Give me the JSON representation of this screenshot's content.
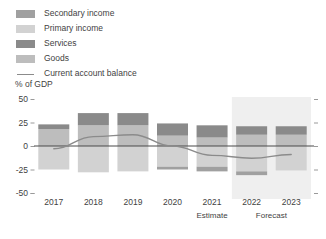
{
  "legend": {
    "items": [
      {
        "label": "Secondary income",
        "color": "#a0a0a0",
        "kind": "swatch",
        "icon": "legend-swatch"
      },
      {
        "label": "Primary income",
        "color": "#d2d2d2",
        "kind": "swatch",
        "icon": "legend-swatch"
      },
      {
        "label": "Services",
        "color": "#8a8a8a",
        "kind": "swatch",
        "icon": "legend-swatch"
      },
      {
        "label": "Goods",
        "color": "#bdbdbd",
        "kind": "swatch",
        "icon": "legend-swatch"
      },
      {
        "label": "Current account balance",
        "color": "#8b8b8b",
        "kind": "line",
        "icon": "legend-line"
      }
    ]
  },
  "chart_data": {
    "type": "bar",
    "title": "",
    "subtitle": "",
    "xlabel": "",
    "ylabel": "% of GDP",
    "ylim": [
      -50,
      50
    ],
    "yticks": [
      50,
      25,
      0,
      -25,
      -50
    ],
    "ytick_labels": [
      "50",
      "25",
      "0",
      "-25",
      "-50"
    ],
    "grid": false,
    "stacked": true,
    "legend_position": "top-left",
    "categories": [
      "2017",
      "2018",
      "2019",
      "2020",
      "2021",
      "2022",
      "2023"
    ],
    "category_sublabels": [
      "",
      "",
      "",
      "",
      "Estimate",
      "Forecast",
      ""
    ],
    "forecast_band": {
      "from": "2022",
      "to": "2023",
      "color": "#efefef",
      "label": "Forecast"
    },
    "estimate_label": "Estimate",
    "series": [
      {
        "name": "Goods",
        "color": "#bdbdbd",
        "values": [
          18,
          22,
          22,
          11,
          9,
          12,
          12
        ]
      },
      {
        "name": "Services",
        "color": "#8a8a8a",
        "values": [
          5,
          13,
          13,
          13,
          13,
          9,
          9
        ]
      },
      {
        "name": "Primary income",
        "color": "#d2d2d2",
        "values": [
          -25,
          -28,
          -27,
          -22,
          -22,
          -27,
          -26
        ]
      },
      {
        "name": "Secondary income",
        "color": "#a0a0a0",
        "values": [
          0,
          0,
          0,
          -3,
          -5,
          -4,
          0
        ]
      }
    ],
    "line_series": {
      "name": "Current account balance",
      "color": "#8b8b8b",
      "values": [
        -3,
        10,
        12,
        0,
        -10,
        -13,
        -9
      ]
    }
  }
}
